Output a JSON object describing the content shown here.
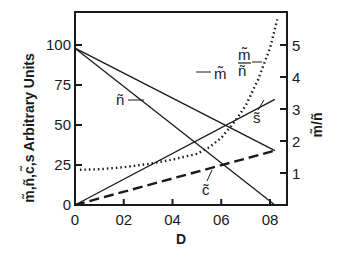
{
  "chart_data": {
    "type": "line",
    "title": "",
    "xlabel": "D",
    "ylabel": "m̃,ñ,c̃,s Arbitrary Units",
    "ylabel_right": "m̃/ñ",
    "xlim": [
      0,
      0.88
    ],
    "ylim": [
      0,
      120
    ],
    "ylim_right": [
      0,
      6
    ],
    "grid": false,
    "x_ticks": [
      "0",
      "02",
      "04",
      "06",
      "08"
    ],
    "x_tick_values": [
      0,
      0.2,
      0.4,
      0.6,
      0.8
    ],
    "y_ticks": [
      "0",
      "25",
      "50",
      "75",
      "100"
    ],
    "y_tick_values": [
      0,
      25,
      50,
      75,
      100
    ],
    "y_right_ticks": [
      "1",
      "2",
      "3",
      "4",
      "5"
    ],
    "y_right_tick_values": [
      1,
      2,
      3,
      4,
      5
    ],
    "series": [
      {
        "name": "m̃",
        "axis": "left",
        "style": "solid",
        "x": [
          0,
          0.82
        ],
        "values": [
          98,
          34
        ]
      },
      {
        "name": "ñ",
        "axis": "left",
        "style": "solid",
        "x": [
          0,
          0.82
        ],
        "values": [
          98,
          0
        ]
      },
      {
        "name": "s̃",
        "axis": "left",
        "style": "solid",
        "x": [
          0,
          0.82
        ],
        "values": [
          0,
          66
        ]
      },
      {
        "name": "c̃",
        "axis": "left",
        "style": "dashed",
        "x": [
          0,
          0.82
        ],
        "values": [
          0,
          34
        ]
      },
      {
        "name": "m̃/ñ",
        "axis": "right",
        "style": "dotted",
        "x": [
          0.02,
          0.1,
          0.2,
          0.3,
          0.4,
          0.5,
          0.55,
          0.6,
          0.65,
          0.7,
          0.75,
          0.8,
          0.83
        ],
        "values": [
          1.1,
          1.12,
          1.18,
          1.28,
          1.42,
          1.6,
          1.8,
          2.1,
          2.55,
          3.1,
          3.9,
          4.9,
          5.8
        ]
      }
    ],
    "annotations": [
      {
        "text": "m̃",
        "target": "m̃"
      },
      {
        "text": "ñ",
        "target": "ñ"
      },
      {
        "text": "s̃",
        "target": "s̃"
      },
      {
        "text": "c̃",
        "target": "c̃"
      },
      {
        "text": "m̃/ñ",
        "target": "m̃/ñ"
      }
    ]
  },
  "labels": {
    "x_axis_title": "D",
    "y_axis_title": "m̃,ñ,c̃,s Arbitrary Units",
    "y_right_title": "m̃/ñ",
    "series_m": "m̃",
    "series_n": "ñ",
    "series_s": "s̃",
    "series_c": "c̃",
    "ratio_num": "m̃",
    "ratio_den": "ñ"
  }
}
